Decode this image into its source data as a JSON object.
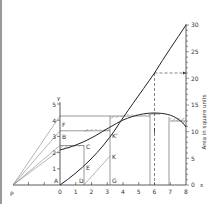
{
  "diagram": {
    "left_axis": {
      "label": "y",
      "ticks": [
        "1",
        "2",
        "3",
        "4",
        "5"
      ]
    },
    "x_axis": {
      "label": "x",
      "ticks": [
        "0",
        "1",
        "2",
        "3",
        "4",
        "5",
        "6",
        "7",
        "8"
      ]
    },
    "right_axis": {
      "label": "Area in square units",
      "ticks": [
        "0",
        "5",
        "10",
        "15",
        "20",
        "25",
        "30"
      ]
    },
    "points": {
      "P": "P",
      "A": "A",
      "B": "B",
      "C": "C",
      "D": "D",
      "E": "E",
      "F": "F",
      "G": "G",
      "K": "K",
      "K_prime": "K'"
    },
    "annotations": {
      "area_at_6": "21",
      "total_area": "30"
    }
  }
}
